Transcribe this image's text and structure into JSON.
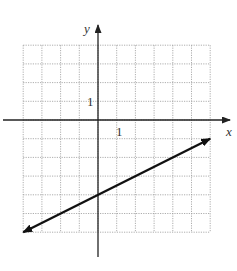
{
  "chart_data": {
    "type": "line",
    "title": "",
    "xlabel": "x",
    "ylabel": "y",
    "xlim": [
      -4,
      6
    ],
    "ylim": [
      -6,
      4
    ],
    "grid": true,
    "tick_labels": {
      "x_unit": "1",
      "y_unit": "1"
    },
    "series": [
      {
        "name": "line",
        "equation": "y = 0.5x - 4",
        "x": [
          -4,
          0,
          6
        ],
        "y": [
          -6,
          -4,
          -1
        ],
        "arrows_both_ends": true
      }
    ]
  },
  "axes": {
    "x_label": "x",
    "y_label": "y",
    "x_tick": "1",
    "y_tick": "1"
  }
}
